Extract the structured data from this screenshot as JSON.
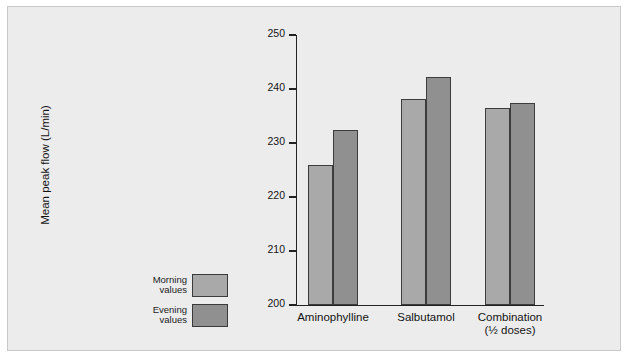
{
  "chart_data": {
    "type": "bar",
    "title": "",
    "xlabel": "",
    "ylabel": "Mean peak flow (L/min)",
    "categories": [
      "Aminophylline",
      "Salbutamol",
      "Combination\n(½ doses)"
    ],
    "series": [
      {
        "name": "Morning\nvalues",
        "values": [
          226.0,
          238.2,
          236.4
        ],
        "color": "#a9a9a9"
      },
      {
        "name": "Evening\nvalues",
        "values": [
          232.5,
          242.3,
          237.5
        ],
        "color": "#909090"
      }
    ],
    "ylim": [
      200,
      250
    ],
    "yticks": [
      200,
      210,
      220,
      230,
      240,
      250
    ],
    "ytick_labels": [
      "200",
      "210",
      "220",
      "230",
      "240",
      "250"
    ],
    "grid": false,
    "legend_position": "left-outside"
  },
  "legend": {
    "morning_label": "Morning\nvalues",
    "evening_label": "Evening\nvalues",
    "morning_color": "#a9a9a9",
    "evening_color": "#909090"
  },
  "colors": {
    "figure_background": "#ececed",
    "page_background": "#ffffff",
    "axis": "#222222",
    "bar_outline": "#3c3c3c"
  }
}
